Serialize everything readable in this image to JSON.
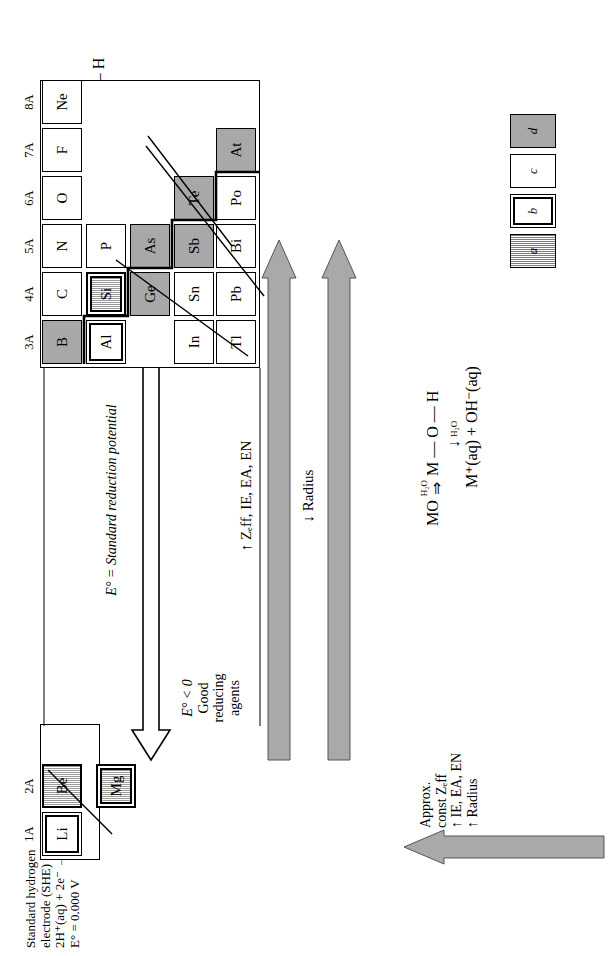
{
  "figure": {
    "she_note": {
      "line1": "Standard hydrogen",
      "line2": "electrode (SHE)",
      "line3": "2H⁺(aq) + 2e⁻ → H₂(g)",
      "line4": "E° = 0.000 V"
    },
    "potential_axis": {
      "label": "E° = Standard reduction potential",
      "left_end": {
        "line1": "E° < 0",
        "line2": "Good",
        "line3": "reducing",
        "line4": "agents"
      },
      "right_end": {
        "line1": "E° > 0",
        "line2": "Good",
        "line3": "oxidizing",
        "line4": "agents"
      }
    },
    "trend_arrows": {
      "up_arrow_label": "↑ Zₑff, IE, EA, EN",
      "down_arrow_label": "↓ Radius",
      "left_arrow": {
        "line1": "Approx.",
        "line2": "const Zₑff",
        "line3": "↑ IE, EA, EN",
        "line4": "↑ Radius"
      }
    },
    "metal_oxide_reaction": {
      "line1": "MO",
      "arrow_label1": "H₂O",
      "line2": "M — O — H",
      "arrow_label2": "H₂O",
      "line3": "M⁺(aq) + OH⁻(aq)"
    },
    "nonmetal_oxide_reaction": {
      "line1": "NMO",
      "arrow_label1": "H₂O",
      "line2": "NM — O — H",
      "arrow_label2": "H₂O",
      "line3": "NMO⁻(aq)",
      "line4": "+",
      "line5": "H₃O⁺(aq)"
    },
    "legend": [
      {
        "key": "a",
        "label": "a",
        "style": "hatched"
      },
      {
        "key": "b",
        "label": "b",
        "style": "double-border"
      },
      {
        "key": "c",
        "label": "c",
        "style": "plain"
      },
      {
        "key": "d",
        "label": "d",
        "style": "shaded"
      }
    ],
    "groups": [
      "1A",
      "2A",
      "3A",
      "4A",
      "5A",
      "6A",
      "7A",
      "8A"
    ],
    "elements": [
      {
        "symbol": "Li",
        "group": "1A",
        "period": 2,
        "style": "double-border"
      },
      {
        "symbol": "Be",
        "group": "2A",
        "period": 2,
        "style": "hatched"
      },
      {
        "symbol": "Mg",
        "group": "2A",
        "period": 3,
        "style": "double-hatched"
      },
      {
        "symbol": "B",
        "group": "3A",
        "period": 2,
        "style": "shaded"
      },
      {
        "symbol": "C",
        "group": "4A",
        "period": 2,
        "style": "plain"
      },
      {
        "symbol": "N",
        "group": "5A",
        "period": 2,
        "style": "plain"
      },
      {
        "symbol": "O",
        "group": "6A",
        "period": 2,
        "style": "plain"
      },
      {
        "symbol": "F",
        "group": "7A",
        "period": 2,
        "style": "plain"
      },
      {
        "symbol": "Ne",
        "group": "8A",
        "period": 2,
        "style": "plain"
      },
      {
        "symbol": "Al",
        "group": "3A",
        "period": 3,
        "style": "double-border"
      },
      {
        "symbol": "Si",
        "group": "4A",
        "period": 3,
        "style": "hatched"
      },
      {
        "symbol": "P",
        "group": "5A",
        "period": 3,
        "style": "plain"
      },
      {
        "symbol": "In",
        "group": "3A",
        "period": 5,
        "style": "plain"
      },
      {
        "symbol": "Sn",
        "group": "4A",
        "period": 5,
        "style": "plain"
      },
      {
        "symbol": "Ge",
        "group": "4A",
        "period": 4,
        "style": "shaded"
      },
      {
        "symbol": "As",
        "group": "5A",
        "period": 4,
        "style": "shaded"
      },
      {
        "symbol": "Sb",
        "group": "5A",
        "period": 5,
        "style": "shaded"
      },
      {
        "symbol": "Te",
        "group": "6A",
        "period": 5,
        "style": "shaded"
      },
      {
        "symbol": "Tl",
        "group": "3A",
        "period": 6,
        "style": "plain"
      },
      {
        "symbol": "Pb",
        "group": "4A",
        "period": 6,
        "style": "plain"
      },
      {
        "symbol": "Bi",
        "group": "5A",
        "period": 6,
        "style": "plain"
      },
      {
        "symbol": "Po",
        "group": "6A",
        "period": 6,
        "style": "plain"
      },
      {
        "symbol": "At",
        "group": "7A",
        "period": 6,
        "style": "shaded"
      }
    ]
  }
}
